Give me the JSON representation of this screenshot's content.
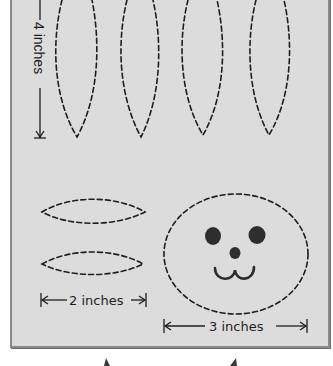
{
  "diagram": {
    "background_color": "#dcdcdc",
    "border_color": "#8a8a8a",
    "line_color": "#1e1e1e",
    "ears": {
      "count": 4,
      "orientation": "vertical",
      "shape": "pointed-oval",
      "outline": "dashed"
    },
    "paws": {
      "count": 2,
      "orientation": "horizontal",
      "shape": "pointed-oval",
      "outline": "dashed"
    },
    "face": {
      "shape": "circle",
      "outline": "dashed",
      "features": [
        "left-eye",
        "right-eye",
        "nose",
        "mouth"
      ]
    },
    "measurements": {
      "ear_height": "4 inches",
      "paw_width": "2 inches",
      "face_width": "3 inches"
    }
  }
}
